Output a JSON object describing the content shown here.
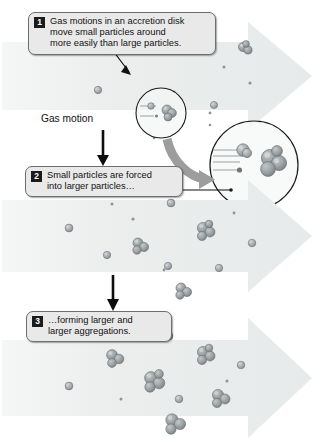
{
  "diagram": {
    "background_color": "#ffffff",
    "band_color": "#eceeee",
    "particle_color": "#9aa0a2",
    "particle_dark": "#7c8386",
    "callout_bg": "#e9e9e9",
    "callout_border": "#6e6e6e",
    "badge_bg": "#1b1b1b",
    "badge_text_color": "#ffffff",
    "arrow_color": "#000000",
    "curved_arrow_color": "#9d9d9d"
  },
  "labels": {
    "gas_motion": "Gas motion"
  },
  "callouts": [
    {
      "number": "1",
      "text": "Gas motions in an accretion disk\nmove small particles around\nmore easily than large particles."
    },
    {
      "number": "2",
      "text": "Small particles are forced\ninto larger particles…"
    },
    {
      "number": "3",
      "text": "…forming larger and\nlarger aggregations."
    }
  ],
  "bands": [
    {
      "name": "stage-1-band",
      "stage": "1",
      "description": "Small particles dispersed, moved easily by gas"
    },
    {
      "name": "stage-2-band",
      "stage": "2",
      "description": "Small particles forced into larger particles"
    },
    {
      "name": "stage-3-band",
      "stage": "3",
      "description": "Larger and larger aggregations forming"
    }
  ],
  "magnifier": {
    "source_label": "collision-detail-source",
    "inset_label": "collision-detail-magnified",
    "description": "Magnified view of a small particle being swept into a larger aggregate by gas flow"
  }
}
